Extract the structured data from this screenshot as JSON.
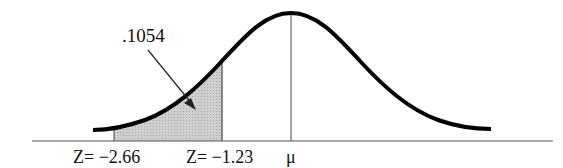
{
  "diagram": {
    "type": "normal-distribution-curve",
    "shaded_area_label": ".1054",
    "labels": {
      "z_left": "Z= −2.66",
      "z_right": "Z= −1.23",
      "mean": "μ"
    },
    "z_values": [
      -2.66,
      -1.23
    ],
    "shaded_region": {
      "from_z": -2.66,
      "to_z": -1.23,
      "area": 0.1054
    },
    "colors": {
      "curve": "#000000",
      "shade": "#c8c8c8",
      "axis": "#555555"
    }
  }
}
